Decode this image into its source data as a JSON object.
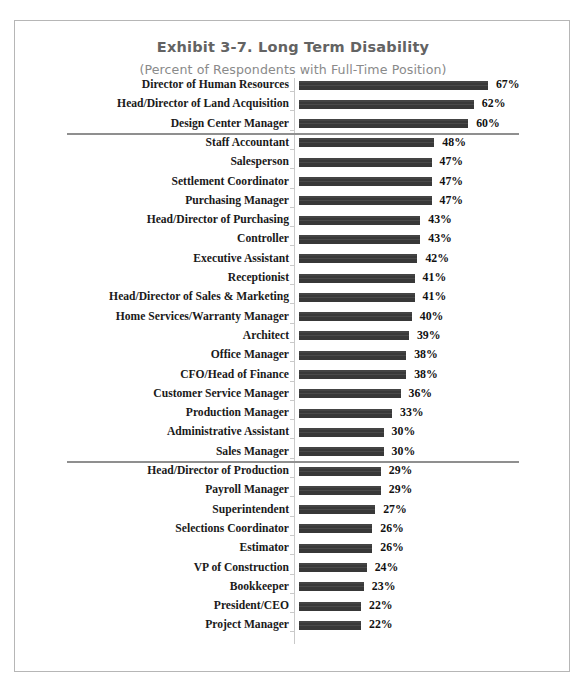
{
  "chart_data": {
    "type": "bar",
    "orientation": "horizontal",
    "title": "Exhibit 3-7.  Long Term Disability",
    "subtitle": "(Percent of Respondents with Full-Time Position)",
    "xlabel": "",
    "ylabel": "",
    "xlim": [
      0,
      67
    ],
    "grid": false,
    "legend": false,
    "value_suffix": "%",
    "bar_color": "#3b3b3b",
    "axis_color": "#c9c9c9",
    "separator_color": "#8f8f8f",
    "title_color": "#636363",
    "subtitle_color": "#8a8a8a",
    "label_color": "#1a1a1a",
    "categories": [
      "Director of Human Resources",
      "Head/Director of Land Acquisition",
      "Design Center Manager",
      "Staff Accountant",
      "Salesperson",
      "Settlement Coordinator",
      "Purchasing Manager",
      "Head/Director of Purchasing",
      "Controller",
      "Executive Assistant",
      "Receptionist",
      "Head/Director of Sales & Marketing",
      "Home Services/Warranty Manager",
      "Architect",
      "Office Manager",
      "CFO/Head of Finance",
      "Customer Service Manager",
      "Production Manager",
      "Administrative Assistant",
      "Sales Manager",
      "Head/Director of Production",
      "Payroll Manager",
      "Superintendent",
      "Selections Coordinator",
      "Estimator",
      "VP of Construction",
      "Bookkeeper",
      "President/CEO",
      "Project Manager"
    ],
    "values": [
      67,
      62,
      60,
      48,
      47,
      47,
      47,
      43,
      43,
      42,
      41,
      41,
      40,
      39,
      38,
      38,
      36,
      33,
      30,
      30,
      29,
      29,
      27,
      26,
      26,
      24,
      23,
      22,
      22
    ],
    "value_labels": [
      "67%",
      "62%",
      "60%",
      "48%",
      "47%",
      "47%",
      "47%",
      "43%",
      "43%",
      "42%",
      "41%",
      "41%",
      "40%",
      "39%",
      "38%",
      "38%",
      "36%",
      "33%",
      "30%",
      "30%",
      "29%",
      "29%",
      "27%",
      "26%",
      "26%",
      "24%",
      "23%",
      "22%",
      "22%"
    ],
    "separators_after_index": [
      2,
      19
    ]
  }
}
